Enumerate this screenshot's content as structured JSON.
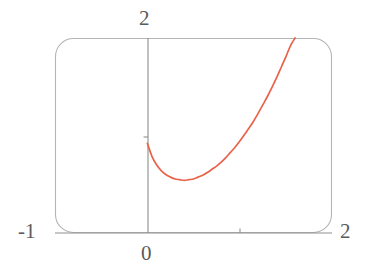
{
  "figure": {
    "width": 367,
    "height": 274,
    "background": "#ffffff",
    "frame": {
      "color": "#b5b5b5",
      "style": "rounded-rectangle",
      "corner_radius": 18,
      "left_px": 55,
      "right_px": 332,
      "top_px": 38,
      "bottom_px": 233
    }
  },
  "labels": {
    "y_max": "2",
    "origin": "0",
    "x_min": "-1",
    "x_max": "2"
  },
  "chart_data": {
    "type": "line",
    "title": "",
    "xlabel": "",
    "ylabel": "",
    "xlim": [
      -1,
      2
    ],
    "ylim": [
      -1,
      2
    ],
    "grid": false,
    "legend": null,
    "axes": {
      "x_axis_drawn_at_y": -1,
      "y_axis_drawn_at_x": 0,
      "x_tick_values": [
        1
      ],
      "y_tick_values": [
        1
      ],
      "labeled_ticks": {
        "x": [
          -1,
          0,
          2
        ],
        "y": [
          2
        ]
      }
    },
    "series": [
      {
        "name": "curve",
        "color": "#e8634a",
        "linewidth": 1.6,
        "domain": [
          0,
          1.62
        ],
        "points": [
          [
            0.0,
            0.38
          ],
          [
            0.05,
            0.18
          ],
          [
            0.1,
            0.05
          ],
          [
            0.15,
            -0.04
          ],
          [
            0.2,
            -0.1
          ],
          [
            0.25,
            -0.14
          ],
          [
            0.3,
            -0.17
          ],
          [
            0.35,
            -0.18
          ],
          [
            0.4,
            -0.19
          ],
          [
            0.45,
            -0.18
          ],
          [
            0.5,
            -0.17
          ],
          [
            0.55,
            -0.14
          ],
          [
            0.6,
            -0.11
          ],
          [
            0.65,
            -0.07
          ],
          [
            0.7,
            -0.02
          ],
          [
            0.75,
            0.03
          ],
          [
            0.8,
            0.09
          ],
          [
            0.85,
            0.16
          ],
          [
            0.9,
            0.24
          ],
          [
            0.95,
            0.32
          ],
          [
            1.0,
            0.41
          ],
          [
            1.05,
            0.51
          ],
          [
            1.1,
            0.61
          ],
          [
            1.15,
            0.72
          ],
          [
            1.2,
            0.84
          ],
          [
            1.25,
            0.97
          ],
          [
            1.3,
            1.1
          ],
          [
            1.35,
            1.24
          ],
          [
            1.4,
            1.39
          ],
          [
            1.45,
            1.55
          ],
          [
            1.5,
            1.71
          ],
          [
            1.55,
            1.88
          ],
          [
            1.6,
            2.0
          ]
        ],
        "minimum": {
          "x": 0.4,
          "y": -0.19
        },
        "start_point": {
          "x": 0.0,
          "y": 0.38
        },
        "exits_top_at_x": 1.62
      }
    ]
  }
}
